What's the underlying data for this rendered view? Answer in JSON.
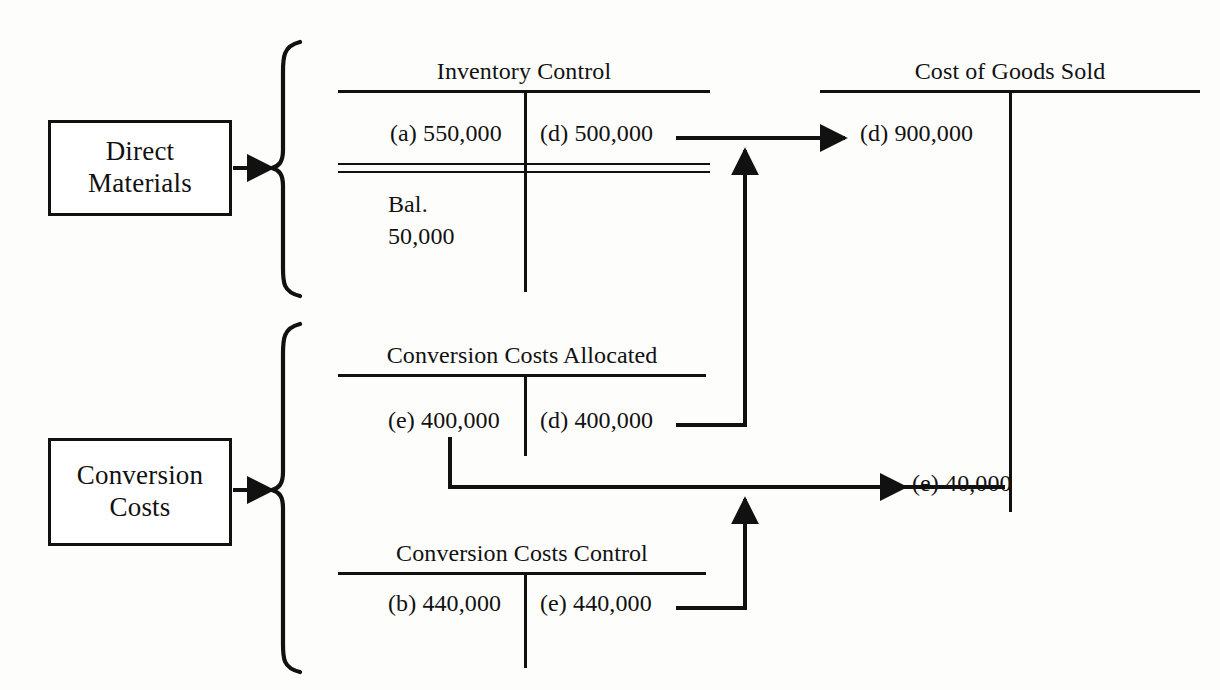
{
  "diagram": {
    "source_boxes": [
      {
        "id": "direct-materials",
        "line1": "Direct",
        "line2": "Materials"
      },
      {
        "id": "conversion-costs",
        "line1": "Conversion",
        "line2": "Costs"
      }
    ],
    "accounts": [
      {
        "id": "inventory-control",
        "title": "Inventory Control",
        "debit": "(a) 550,000",
        "credit": "(d) 500,000",
        "balance_label": "Bal.",
        "balance_value": "50,000",
        "has_double_rule": true
      },
      {
        "id": "cost-of-goods-sold",
        "title": "Cost of Goods Sold",
        "debit": "(d) 900,000",
        "debit2": "(e) 40,000",
        "credit": "",
        "has_double_rule": false
      },
      {
        "id": "conversion-costs-allocated",
        "title": "Conversion Costs Allocated",
        "debit": "(e) 400,000",
        "credit": "(d) 400,000",
        "has_double_rule": false
      },
      {
        "id": "conversion-costs-control",
        "title": "Conversion Costs Control",
        "debit": "(b) 440,000",
        "credit": "(e) 440,000",
        "has_double_rule": false
      }
    ],
    "colors": {
      "ink": "#111111",
      "paper": "#fdfdfb"
    }
  }
}
